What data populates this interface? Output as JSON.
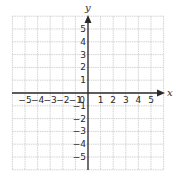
{
  "diagram": {
    "type": "coordinate-plane",
    "x_axis_label": "x",
    "y_axis_label": "y",
    "grid_range": {
      "min": -6,
      "max": 6
    },
    "x_tick_labels": [
      "−5",
      "−4",
      "−3",
      "−2",
      "−1",
      "0",
      "1",
      "2",
      "3",
      "4",
      "5"
    ],
    "x_tick_values": [
      -5,
      -4,
      -3,
      -2,
      -1,
      0,
      1,
      2,
      3,
      4,
      5
    ],
    "y_tick_labels": [
      "5",
      "4",
      "3",
      "2",
      "1",
      "−1",
      "−2",
      "−3",
      "−4",
      "−5"
    ],
    "y_tick_values": [
      5,
      4,
      3,
      2,
      1,
      -1,
      -2,
      -3,
      -4,
      -5
    ],
    "colors": {
      "grid": "#c8c8c8",
      "axis": "#2a2a2a",
      "background": "#ffffff"
    }
  }
}
